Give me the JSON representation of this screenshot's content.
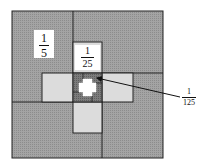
{
  "diagram": {
    "title": "",
    "colors": {
      "outer_fill": "#a8a8a8",
      "arm_fill": "#d6d6d6",
      "center_fill": "#7a7a7a",
      "stroke": "#222222",
      "label_box": "#ffffff",
      "plus": "#ffffff"
    },
    "labels": [
      {
        "id": "one-fifth",
        "numerator": "1",
        "denominator": "5"
      },
      {
        "id": "one-twentyfifth",
        "numerator": "1",
        "denominator": "25"
      },
      {
        "id": "one-hundredtwentyfifth",
        "numerator": "1",
        "denominator": "125"
      }
    ],
    "regions": [
      {
        "id": "outer-square",
        "level": 1
      },
      {
        "id": "arm-top",
        "level": 2
      },
      {
        "id": "arm-left",
        "level": 2
      },
      {
        "id": "arm-right",
        "level": 2
      },
      {
        "id": "arm-bottom",
        "level": 2
      },
      {
        "id": "center-square",
        "level": 3
      },
      {
        "id": "center-plus",
        "level": 4
      }
    ],
    "arrow": {
      "from_label": "1/125",
      "to_region": "center-square"
    }
  }
}
